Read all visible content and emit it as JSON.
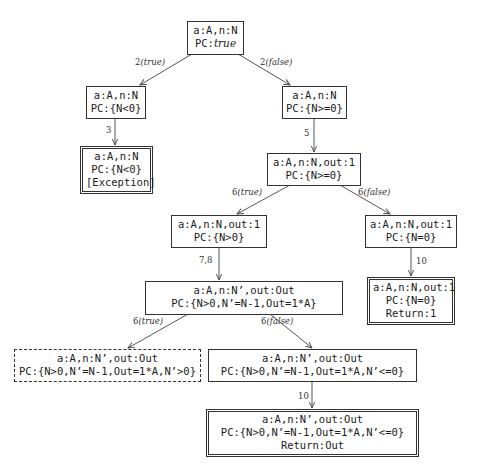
{
  "diagram": {
    "type": "symbolic-execution-tree",
    "nodes": [
      {
        "id": "n0",
        "lines": [
          "a:A,n:N",
          "PC:"
        ],
        "pc_italic": "true",
        "style": "normal"
      },
      {
        "id": "n1",
        "lines": [
          "a:A,n:N",
          "PC:{N<0}"
        ],
        "style": "normal"
      },
      {
        "id": "n2",
        "lines": [
          "a:A,n:N",
          "PC:{N>=0}"
        ],
        "style": "normal"
      },
      {
        "id": "n3",
        "lines": [
          "a:A,n:N",
          "PC:{N<0}",
          "[Exception]"
        ],
        "style": "final"
      },
      {
        "id": "n4",
        "lines": [
          "a:A,n:N,out:1",
          "PC:{N>=0}"
        ],
        "style": "normal"
      },
      {
        "id": "n5",
        "lines": [
          "a:A,n:N,out:1",
          "PC:{N>0}"
        ],
        "style": "normal"
      },
      {
        "id": "n6",
        "lines": [
          "a:A,n:N,out:1",
          "PC:{N=0}"
        ],
        "style": "normal"
      },
      {
        "id": "n7",
        "lines": [
          "a:A,n:N,out:1",
          "PC:{N=0}",
          "Return:1"
        ],
        "style": "final"
      },
      {
        "id": "n8",
        "lines": [
          "a:A,n:N’,out:Out",
          "PC:{N>0,N’=N-1,Out=1*A}"
        ],
        "style": "normal"
      },
      {
        "id": "n9",
        "lines": [
          "a:A,n:N’,out:Out",
          "PC:{N>0,N’=N-1,Out=1*A,N’>0}"
        ],
        "style": "dashed"
      },
      {
        "id": "n10",
        "lines": [
          "a:A,n:N’,out:Out",
          "PC:{N>0,N’=N-1,Out=1*A,N’<=0}"
        ],
        "style": "normal"
      },
      {
        "id": "n11",
        "lines": [
          "a:A,n:N’,out:Out",
          "PC:{N>0,N’=N-1,Out=1*A,N’<=0}",
          "Return:Out"
        ],
        "style": "final"
      }
    ],
    "edges": [
      {
        "from": "n0",
        "to": "n1",
        "label_num": "2",
        "label_cond": "(true)"
      },
      {
        "from": "n0",
        "to": "n2",
        "label_num": "2",
        "label_cond": "(false)"
      },
      {
        "from": "n1",
        "to": "n3",
        "label_num": "3",
        "label_cond": ""
      },
      {
        "from": "n2",
        "to": "n4",
        "label_num": "5",
        "label_cond": ""
      },
      {
        "from": "n4",
        "to": "n5",
        "label_num": "6",
        "label_cond": "(true)"
      },
      {
        "from": "n4",
        "to": "n6",
        "label_num": "6",
        "label_cond": "(false)"
      },
      {
        "from": "n5",
        "to": "n8",
        "label_num": "7,8",
        "label_cond": ""
      },
      {
        "from": "n6",
        "to": "n7",
        "label_num": "10",
        "label_cond": ""
      },
      {
        "from": "n8",
        "to": "n9",
        "label_num": "6",
        "label_cond": "(true)"
      },
      {
        "from": "n8",
        "to": "n10",
        "label_num": "6",
        "label_cond": "(false)"
      },
      {
        "from": "n10",
        "to": "n11",
        "label_num": "10",
        "label_cond": ""
      }
    ]
  },
  "colors": {
    "line": "#444444",
    "text": "#1a1a1a",
    "background": "#ffffff"
  }
}
